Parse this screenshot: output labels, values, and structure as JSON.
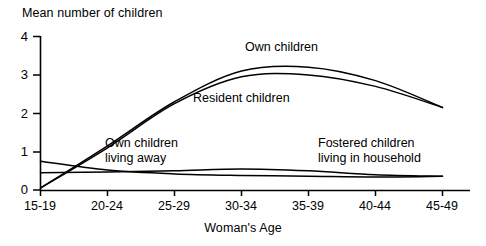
{
  "chart_data": {
    "type": "line",
    "title": "",
    "ylabel": "Mean number of children",
    "xlabel": "Woman's Age",
    "categories": [
      "15-19",
      "20-24",
      "25-29",
      "30-34",
      "35-39",
      "40-44",
      "45-49"
    ],
    "ylim": [
      0,
      4
    ],
    "yticks": [
      0,
      1,
      2,
      3,
      4
    ],
    "ytick_labels": [
      "0",
      "1",
      "2",
      "3",
      "4"
    ],
    "grid": false,
    "legend_position": "inline-annotations",
    "series": [
      {
        "name": "Own children",
        "label_position": "above-peak",
        "values": [
          0.05,
          1.15,
          2.3,
          3.1,
          3.2,
          2.85,
          2.15
        ]
      },
      {
        "name": "Resident children",
        "label_position": "below-curve-left",
        "values": [
          0.05,
          1.1,
          2.25,
          2.95,
          3.0,
          2.7,
          2.15
        ]
      },
      {
        "name": "Own children living away",
        "label_position": "inline-left",
        "values": [
          0.75,
          0.52,
          0.42,
          0.38,
          0.36,
          0.34,
          0.36
        ]
      },
      {
        "name": "Fostered children living in household",
        "label_position": "inline-right",
        "values": [
          0.45,
          0.47,
          0.5,
          0.55,
          0.5,
          0.4,
          0.36
        ]
      }
    ],
    "annotations": [
      {
        "text": "Own children",
        "x_category": "30-34",
        "y_value": 3.7
      },
      {
        "text": "Resident children",
        "x_category": "27",
        "y_value": 2.5
      },
      {
        "text": "Own children living away",
        "x_category": "22",
        "y_value": 1.35
      },
      {
        "text": "Fostered children living in household",
        "x_category": "37",
        "y_value": 1.35
      }
    ],
    "colors": {
      "line": "#000000",
      "axis": "#000000",
      "background": "#ffffff"
    }
  },
  "labels": {
    "y_axis_title": "Mean number of children",
    "x_axis_title": "Woman's Age",
    "y_ticks": [
      "4",
      "3",
      "2",
      "1",
      "0"
    ],
    "x_ticks": [
      "15-19",
      "20-24",
      "25-29",
      "30-34",
      "35-39",
      "40-44",
      "45-49"
    ],
    "series_own_children": "Own children",
    "series_resident_children": "Resident children",
    "series_own_away_line1": "Own children",
    "series_own_away_line2": "living away",
    "series_fostered_line1": "Fostered children",
    "series_fostered_line2": "living in household"
  }
}
